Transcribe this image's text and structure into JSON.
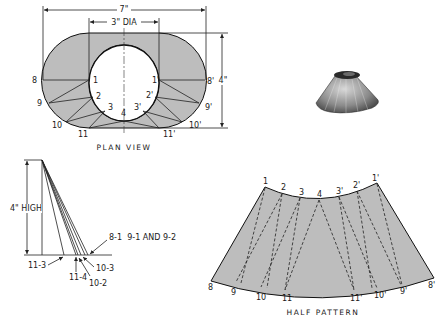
{
  "colors": {
    "fill": "#bdbdbd",
    "line": "#222222",
    "background": "#ffffff"
  },
  "plan_view": {
    "caption": "PLAN VIEW",
    "overall_width_label": "7\"",
    "hole_diameter_label": "3\" DIA",
    "depth_label": "4\"",
    "outer_points": [
      "8",
      "9",
      "10",
      "11",
      "11'",
      "10'",
      "9'",
      "8'"
    ],
    "inner_points": [
      "1",
      "2",
      "3",
      "4",
      "3'",
      "2'",
      "1'"
    ]
  },
  "true_length_diagram": {
    "height_label": "4\" HIGH",
    "callouts": [
      "8-1  9-1 AND 9-2",
      "11-3",
      "11-4",
      "10-2",
      "10-3"
    ]
  },
  "half_pattern": {
    "caption": "HALF PATTERN",
    "top_points": [
      "1",
      "2",
      "3",
      "4",
      "3'",
      "2'",
      "1'"
    ],
    "bottom_points": [
      "8",
      "9",
      "10",
      "11",
      "11'",
      "10'",
      "9'",
      "8'"
    ]
  },
  "photo": {
    "description": "finished truncated cone transition piece"
  }
}
